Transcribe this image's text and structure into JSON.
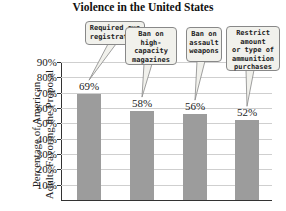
{
  "chart_data": {
    "type": "bar",
    "title": "Violence in the United States",
    "xlabel": "",
    "ylabel": "Percentage of American Adults Favoring the Proposal",
    "ylim": [
      0,
      90
    ],
    "yticks": [
      "10%",
      "20%",
      "30%",
      "40%",
      "50%",
      "60%",
      "70%",
      "80%",
      "90%"
    ],
    "grid": true,
    "categories": [
      "Required gun registration",
      "Ban on high-capacity magazines",
      "Ban on assault weapons",
      "Restrict amount or type of ammunition purchases"
    ],
    "values": [
      69,
      58,
      56,
      52
    ],
    "value_labels": [
      "69%",
      "58%",
      "56%",
      "52%"
    ],
    "callouts": [
      "Required gun\nregistration",
      "Ban on\nhigh-capacity\nmagazines",
      "Ban on\nassault\nweapons",
      "Restrict amount\nor type of\nammunition\npurchases"
    ],
    "colors": {
      "bar": "#9c9c9c",
      "grid": "#cfcfcf",
      "callout_bg": "#f1f1ec"
    }
  },
  "ylabel_lines": [
    "Percentage of American",
    "Adults Favoring the Proposal"
  ]
}
